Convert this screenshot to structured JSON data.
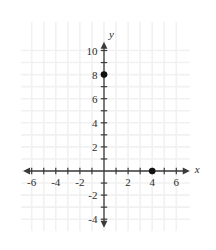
{
  "chart_data": {
    "type": "scatter",
    "title": "",
    "xlabel": "x",
    "ylabel": "y",
    "xlim": [
      -6.8,
      7.2
    ],
    "ylim": [
      -4.8,
      10.8
    ],
    "grid": true,
    "legend": "none",
    "x_ticks": [
      -6,
      -4,
      -2,
      2,
      4,
      6
    ],
    "y_ticks": [
      -4,
      -2,
      2,
      4,
      6,
      8,
      10
    ],
    "x_tick_labels": [
      "-6",
      "-4",
      "-2",
      "2",
      "4",
      "6"
    ],
    "y_tick_labels": [
      "-4",
      "-2",
      "2",
      "4",
      "6",
      "8",
      "10"
    ],
    "minor_tick_step": 1,
    "points": [
      {
        "label": "(0, 8)",
        "x": 0,
        "y": 8
      },
      {
        "label": "(4, 0)",
        "x": 4,
        "y": 0
      }
    ],
    "series": [
      {
        "name": "plotted points",
        "x": [
          0,
          4
        ],
        "y": [
          8,
          0
        ]
      }
    ]
  },
  "style": {
    "axis_color": "#3a3a3a",
    "grid_color": "#f1f1f1",
    "point_color": "#111111",
    "text_color": "#2b2b2b",
    "background": "#ffffff"
  },
  "axes": {
    "x_axis_name": "x",
    "y_axis_name": "y"
  }
}
